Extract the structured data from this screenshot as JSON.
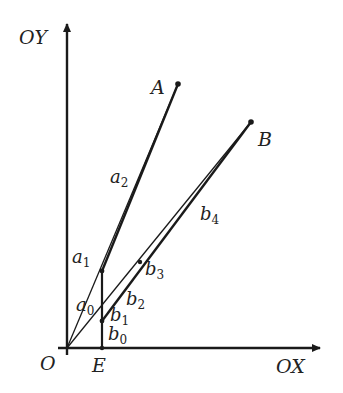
{
  "figure": {
    "axes": {
      "y_label": "OY",
      "x_label": "OX"
    },
    "points": {
      "origin": "O",
      "E": "E",
      "A": "A",
      "B": "B"
    },
    "labels": {
      "a0": {
        "base": "a",
        "sub": "0"
      },
      "a1": {
        "base": "a",
        "sub": "1"
      },
      "a2": {
        "base": "a",
        "sub": "2"
      },
      "b0": {
        "base": "b",
        "sub": "0"
      },
      "b1": {
        "base": "b",
        "sub": "1"
      },
      "b2": {
        "base": "b",
        "sub": "2"
      },
      "b3": {
        "base": "b",
        "sub": "3"
      },
      "b4": {
        "base": "b",
        "sub": "4"
      }
    },
    "colors": {
      "stroke": "#1a1a1a",
      "background": "#ffffff"
    }
  }
}
